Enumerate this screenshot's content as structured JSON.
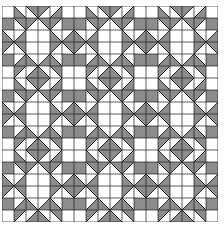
{
  "quilt": {
    "title": "Quilt block pattern",
    "grid_cells": 18,
    "cell_px": 12,
    "block_repeat": 3,
    "colors": {
      "light": "#ffffff",
      "dark": "#8c8c8c",
      "line": "#1a1a1a"
    },
    "block": [
      [
        "W",
        "BL",
        "TR",
        "TL",
        "BR",
        "W"
      ],
      [
        "G",
        "TR",
        "TL",
        "TR",
        "TL",
        "G"
      ],
      [
        "BL",
        "BR",
        "W",
        "W",
        "BL",
        "BR"
      ],
      [
        "TL",
        "TR",
        "W",
        "W",
        "TL",
        "TR"
      ],
      [
        "G",
        "BR",
        "BL",
        "BR",
        "BL",
        "G"
      ],
      [
        "W",
        "TL",
        "BR",
        "BL",
        "TR",
        "W"
      ]
    ]
  }
}
